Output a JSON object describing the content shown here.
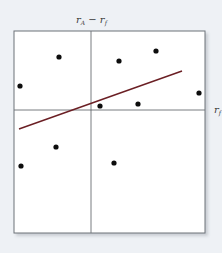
{
  "chart_data": {
    "type": "scatter",
    "title": "",
    "ylabel": "r_A − r_f",
    "xlabel": "r_M − r_f",
    "ylabel_parts": {
      "base": "r",
      "sub": "A",
      "rest": " − r",
      "sub2": "f"
    },
    "xlabel_parts": {
      "base": "r",
      "sub": "f"
    },
    "axes": {
      "quadrant_lines": true,
      "grid": false,
      "ticks": false,
      "xlim": [
        -77,
        114
      ],
      "ylim": [
        -123,
        79
      ]
    },
    "points": [
      {
        "x": -32,
        "y": 53
      },
      {
        "x": -71,
        "y": 24
      },
      {
        "x": 28,
        "y": 49
      },
      {
        "x": 65,
        "y": 59
      },
      {
        "x": 108,
        "y": 17
      },
      {
        "x": 9,
        "y": 4
      },
      {
        "x": 47,
        "y": 6
      },
      {
        "x": -35,
        "y": -37
      },
      {
        "x": -70,
        "y": -56
      },
      {
        "x": 23,
        "y": -53
      }
    ],
    "regression_line": {
      "x1": -72,
      "y1": -19,
      "x2": 91,
      "y2": 39
    },
    "colors": {
      "points": "#0d0d0d",
      "regression_line": "#6b1f24",
      "axes": "#555a60",
      "frame": "#6d7278",
      "background": "#eef1f5",
      "plot_background": "#ffffff"
    }
  }
}
